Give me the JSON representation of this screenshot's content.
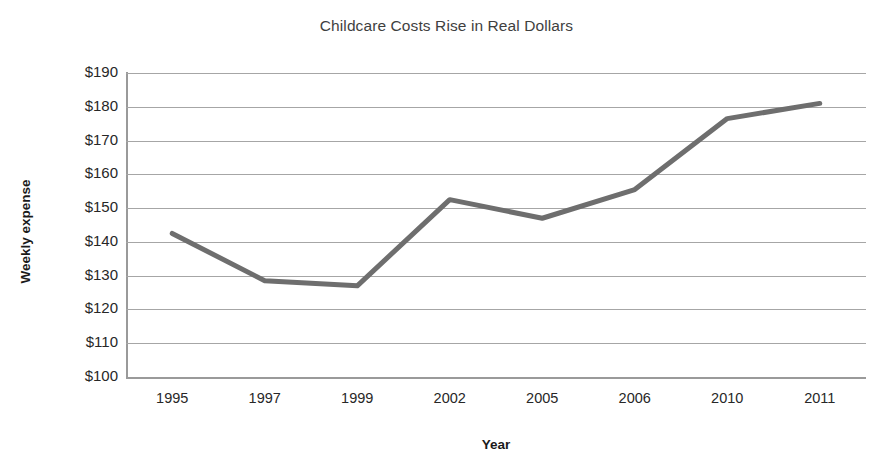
{
  "chart_data": {
    "type": "line",
    "title": "Childcare Costs Rise in Real Dollars",
    "xlabel": "Year",
    "ylabel": "Weekly expense",
    "categories": [
      "1995",
      "1997",
      "1999",
      "2002",
      "2005",
      "2006",
      "2010",
      "2011"
    ],
    "values": [
      142.5,
      128.5,
      127,
      152.5,
      147,
      155.5,
      176.5,
      181
    ],
    "series": [
      {
        "name": "Weekly expense",
        "values": [
          142.5,
          128.5,
          127,
          152.5,
          147,
          155.5,
          176.5,
          181
        ]
      }
    ],
    "ylim": [
      100,
      190
    ],
    "ytick_step": 10,
    "ytick_labels": [
      "$190",
      "$180",
      "$170",
      "$160",
      "$150",
      "$140",
      "$130",
      "$120",
      "$110",
      "$100"
    ],
    "ytick_values": [
      190,
      180,
      170,
      160,
      150,
      140,
      130,
      120,
      110,
      100
    ],
    "grid": "horizontal",
    "legend": "none",
    "line_color": "#6e6e6e",
    "grid_color": "#a6a6a6",
    "axis_color": "#9a9a9a",
    "title_color": "#3f3f3f",
    "label_color": "#272727"
  }
}
